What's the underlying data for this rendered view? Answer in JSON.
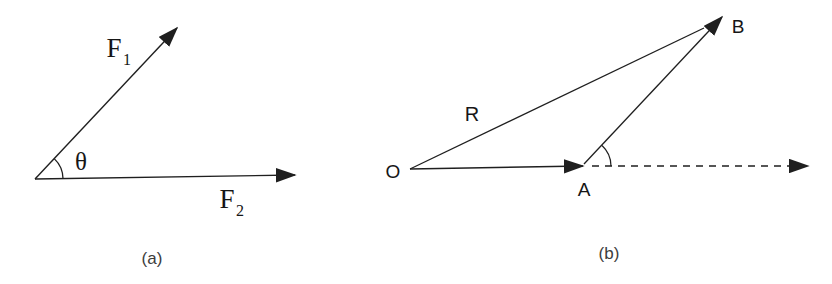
{
  "figure": {
    "colors": {
      "background": "#ffffff",
      "line": "#1f1f1f",
      "text": "#161616",
      "caption": "#3c3c3c"
    },
    "panel_a": {
      "caption": "(a)",
      "force1": {
        "base": "F",
        "sub": "1"
      },
      "force2": {
        "base": "F",
        "sub": "2"
      },
      "angle": "θ"
    },
    "panel_b": {
      "caption": "(b)",
      "origin": "O",
      "point_a": "A",
      "point_b": "B",
      "resultant": "R"
    }
  }
}
